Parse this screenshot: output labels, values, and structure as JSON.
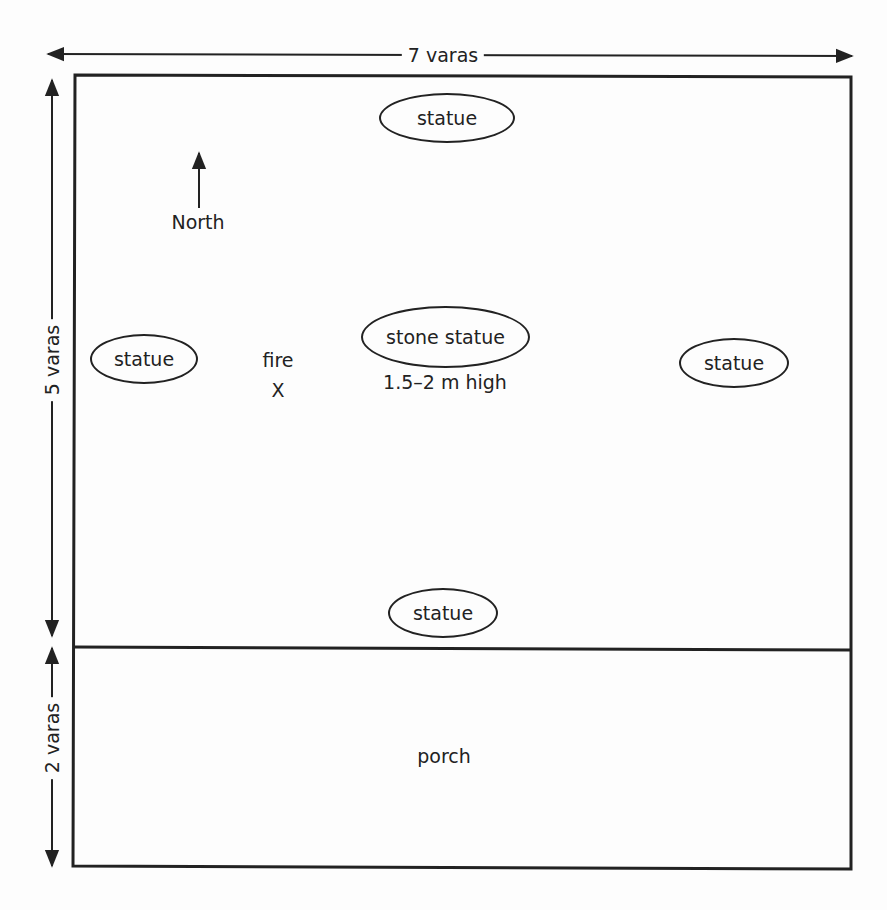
{
  "diagram": {
    "type": "floor-plan",
    "dimensions": {
      "width_label": "7 varas",
      "main_room_height_label": "5 varas",
      "porch_height_label": "2 varas"
    },
    "compass": {
      "label": "North",
      "direction": "up"
    },
    "main_room": {
      "features": [
        {
          "id": "statue-north",
          "label": "statue",
          "shape": "ellipse"
        },
        {
          "id": "statue-west",
          "label": "statue",
          "shape": "ellipse"
        },
        {
          "id": "stone-statue-center",
          "label": "stone statue",
          "shape": "ellipse",
          "note": "1.5–2 m high"
        },
        {
          "id": "statue-east",
          "label": "statue",
          "shape": "ellipse"
        },
        {
          "id": "statue-south",
          "label": "statue",
          "shape": "ellipse"
        }
      ],
      "fire": {
        "label": "fire",
        "marker": "X"
      }
    },
    "porch": {
      "label": "porch"
    },
    "colors": {
      "line": "#222222",
      "background": "#fdfdfd"
    }
  }
}
